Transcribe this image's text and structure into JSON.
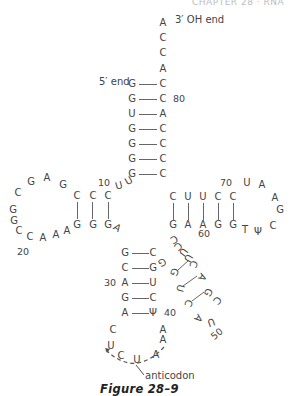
{
  "header": {
    "text": "CHAPTER 28 · RNA"
  },
  "figure": {
    "caption": "Figure 28–9",
    "labels": {
      "three_prime": "3′ OH end",
      "five_prime": "5′ end",
      "anticodon": "anticodon"
    },
    "numbers": {
      "n10": "10",
      "n20": "20",
      "n30": "30",
      "n40": "40",
      "n50": "50",
      "n60": "60",
      "n70": "70",
      "n80": "80"
    },
    "acceptor_tail": [
      "A",
      "C",
      "C",
      "A"
    ],
    "acceptor_stem": [
      {
        "left": "G",
        "right": "C"
      },
      {
        "left": "G",
        "right": "C"
      },
      {
        "left": "U",
        "right": "A"
      },
      {
        "left": "G",
        "right": "C"
      },
      {
        "left": "G",
        "right": "C"
      },
      {
        "left": "G",
        "right": "C"
      },
      {
        "left": "G",
        "right": "C"
      }
    ],
    "d_arm": {
      "linker": [
        "U",
        "U"
      ],
      "stem_top": [
        "C",
        "C",
        "C"
      ],
      "stem_bottom": [
        "G",
        "G",
        "G"
      ],
      "loop": [
        "G",
        "A",
        "G",
        "C",
        "G",
        "G",
        "C",
        "C",
        "A",
        "A",
        "A"
      ],
      "junction": "A"
    },
    "anticodon_arm": {
      "stem": [
        {
          "left": "G",
          "right": "C"
        },
        {
          "left": "C",
          "right": "G"
        },
        {
          "left": "A",
          "right": "U"
        },
        {
          "left": "G",
          "right": "C"
        },
        {
          "left": "A",
          "right": "Ψ"
        }
      ],
      "loop": [
        "C",
        "U",
        "C",
        "U",
        "A",
        "A",
        "A"
      ],
      "anticodon": [
        "C",
        "U",
        "A"
      ]
    },
    "variable_loop": [
      "G",
      "C",
      "C",
      "U",
      "U",
      "C",
      "G",
      "U",
      "C",
      "A",
      "G",
      "C",
      "U",
      "A"
    ],
    "t_arm": {
      "stem_top": [
        "C",
        "U",
        "U",
        "C",
        "C"
      ],
      "stem_bottom": [
        "G",
        "A",
        "A",
        "G",
        "G"
      ],
      "loop": [
        "U",
        "A",
        "A",
        "G",
        "C",
        "Ψ",
        "T"
      ]
    }
  }
}
